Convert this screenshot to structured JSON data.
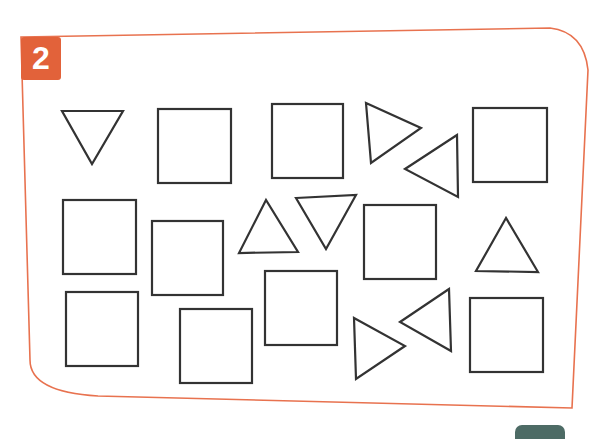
{
  "exercise": {
    "number": "2",
    "badge_color": "#e2623a",
    "frame_color": "#e8724f",
    "shape_stroke": "#333333",
    "bottom_tab_color": "#4d6b65"
  },
  "shapes": [
    {
      "type": "triangle",
      "orientation": "down",
      "points": "62,111 123,111 92,164"
    },
    {
      "type": "square",
      "x": 158,
      "y": 109,
      "w": 73,
      "h": 74
    },
    {
      "type": "square",
      "x": 272,
      "y": 104,
      "w": 71,
      "h": 74
    },
    {
      "type": "triangle",
      "orientation": "right",
      "points": "366,103 421,128 371,163"
    },
    {
      "type": "triangle",
      "orientation": "left",
      "points": "457,135 405,169 458,197"
    },
    {
      "type": "square",
      "x": 473,
      "y": 108,
      "w": 74,
      "h": 74
    },
    {
      "type": "square",
      "x": 63,
      "y": 200,
      "w": 73,
      "h": 74
    },
    {
      "type": "square",
      "x": 152,
      "y": 221,
      "w": 71,
      "h": 74
    },
    {
      "type": "triangle",
      "orientation": "up",
      "points": "266,200 239,253 298,252"
    },
    {
      "type": "triangle",
      "orientation": "down",
      "points": "296,198 356,195 326,249"
    },
    {
      "type": "square",
      "x": 364,
      "y": 205,
      "w": 72,
      "h": 74
    },
    {
      "type": "triangle",
      "orientation": "up",
      "points": "506,218 476,271 538,272"
    },
    {
      "type": "square",
      "x": 66,
      "y": 292,
      "w": 72,
      "h": 74
    },
    {
      "type": "square",
      "x": 180,
      "y": 309,
      "w": 72,
      "h": 74
    },
    {
      "type": "square",
      "x": 265,
      "y": 271,
      "w": 72,
      "h": 74
    },
    {
      "type": "triangle",
      "orientation": "right",
      "points": "354,318 405,346 356,379"
    },
    {
      "type": "triangle",
      "orientation": "left",
      "points": "449,289 400,322 451,351"
    },
    {
      "type": "square",
      "x": 470,
      "y": 298,
      "w": 73,
      "h": 74
    }
  ]
}
